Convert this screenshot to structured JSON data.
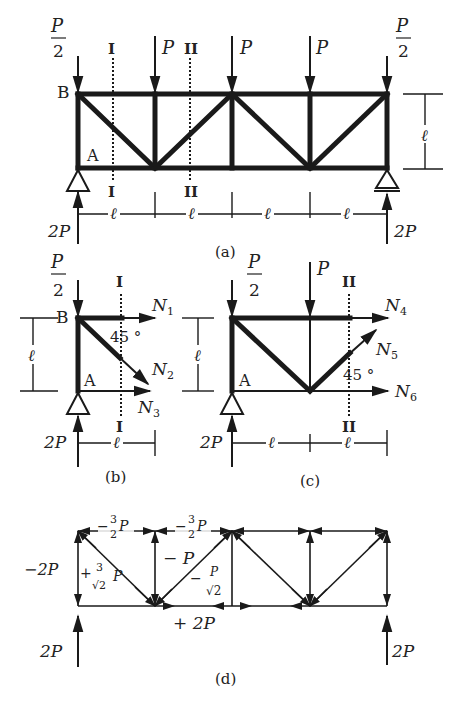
{
  "figure": {
    "panels": [
      {
        "id": "a",
        "caption": "(a)"
      },
      {
        "id": "b",
        "caption": "(b)"
      },
      {
        "id": "c",
        "caption": "(c)"
      },
      {
        "id": "d",
        "caption": "(d)"
      }
    ]
  },
  "panel_a": {
    "loads": {
      "end_left": "P",
      "end_left_den": "2",
      "mid1": "P",
      "mid2": "P",
      "mid3": "P",
      "end_right": "P",
      "end_right_den": "2"
    },
    "node_labels": {
      "B": "B",
      "A": "A"
    },
    "sections": {
      "I_top": "I",
      "I_bot": "I",
      "II_top": "II",
      "II_bot": "II"
    },
    "dims": {
      "height": "ℓ",
      "spans": [
        "ℓ",
        "ℓ",
        "ℓ",
        "ℓ"
      ]
    },
    "reactions": {
      "left": "2P",
      "right": "2P"
    },
    "caption": "(a)"
  },
  "panel_b": {
    "load": "P",
    "load_den": "2",
    "node_labels": {
      "B": "B",
      "A": "A"
    },
    "section_top": "I",
    "section_bot": "I",
    "forces": {
      "n1": "N",
      "n1_sub": "1",
      "n2": "N",
      "n2_sub": "2",
      "n3": "N",
      "n3_sub": "3"
    },
    "angle": "45 °",
    "dims": {
      "height": "ℓ",
      "span": "ℓ"
    },
    "reaction": "2P",
    "caption": "(b)"
  },
  "panel_c": {
    "load_end": "P",
    "load_end_den": "2",
    "load_mid": "P",
    "node_label_A": "A",
    "section_top": "II",
    "section_bot": "II",
    "forces": {
      "n4": "N",
      "n4_sub": "4",
      "n5": "N",
      "n5_sub": "5",
      "n6": "N",
      "n6_sub": "6"
    },
    "angle": "45 °",
    "dims": {
      "height": "ℓ",
      "spans": [
        "ℓ",
        "ℓ"
      ]
    },
    "reaction": "2P",
    "caption": "(c)"
  },
  "panel_d": {
    "member_forces": {
      "top1": "− 3/2 P",
      "top1_sign": "−",
      "top1_num": "3",
      "top1_den": "2",
      "top1_p": "P",
      "top2_sign": "−",
      "top2_num": "3",
      "top2_den": "2",
      "top2_p": "P",
      "left_vertical": "−2P",
      "diag1_sign": "+",
      "diag1_num": "3",
      "diag1_den": "√2",
      "diag1_p": "P",
      "vertical2": "− P",
      "diag2_sign": "−",
      "diag2_num": "P",
      "diag2_den": "√2",
      "bottom": "+ 2P"
    },
    "reactions": {
      "left": "2P",
      "right": "2P"
    },
    "caption": "(d)"
  }
}
